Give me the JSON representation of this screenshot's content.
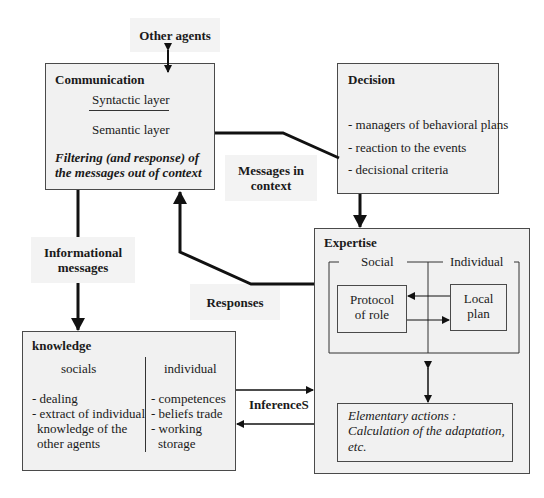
{
  "diagram": {
    "other_agents": "Other agents",
    "communication": {
      "title": "Communication",
      "syntactic": "Syntactic layer",
      "semantic": "Semantic layer",
      "filter_line1": "Filtering (and response) of",
      "filter_line2": "the messages out of context"
    },
    "decision": {
      "title": "Decision",
      "items": [
        "- managers of behavioral plans",
        "- reaction to the events",
        "- decisional criteria"
      ]
    },
    "messages_in_context": {
      "line1": "Messages in",
      "line2": "context"
    },
    "informational_messages": {
      "line1": "Informational",
      "line2": "messages"
    },
    "responses": "Responses",
    "expertise": {
      "title": "Expertise",
      "social": "Social",
      "individual": "Individual",
      "protocol_line1": "Protocol",
      "protocol_line2": "of role",
      "local_line1": "Local",
      "local_line2": "plan",
      "elementary_line1": "Elementary actions :",
      "elementary_line2": "Calculation of the adaptation,",
      "elementary_line3": "etc."
    },
    "knowledge": {
      "title": "knowledge",
      "socials": "socials",
      "individual": "individual",
      "social_items": [
        "- dealing",
        "- extract of individual",
        "knowledge of the",
        "other agents"
      ],
      "individual_items": [
        "- competences",
        "- beliefs trade",
        "- working",
        "storage"
      ]
    },
    "inferences": "InferenceS"
  }
}
